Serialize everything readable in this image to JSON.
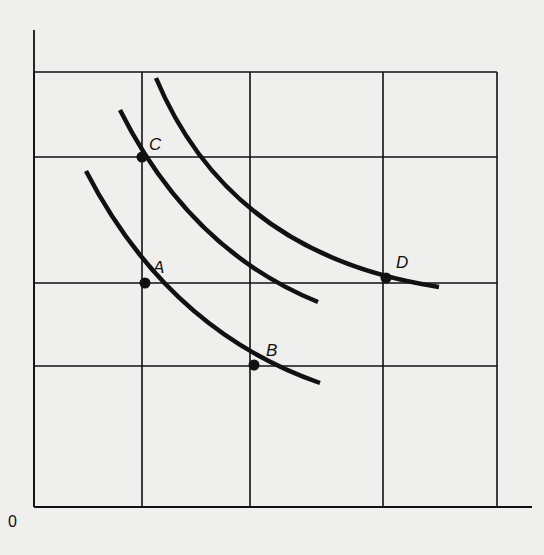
{
  "diagram": {
    "type": "indifference-curve-grid",
    "origin_label": "0",
    "colors": {
      "background": "#efefed",
      "ink": "#111111"
    },
    "axes": {
      "y_axis": {
        "x": 34,
        "y_top": 30,
        "y_bottom": 507
      },
      "x_axis": {
        "y": 507,
        "x_left": 34,
        "x_right": 532
      }
    },
    "grid": {
      "vertical_x": [
        34,
        142,
        250,
        383,
        497
      ],
      "horizontal_y": [
        72,
        157,
        283,
        366,
        507
      ],
      "top": 72,
      "bottom": 507,
      "left": 34,
      "right": 497
    },
    "curves": [
      {
        "name": "curve-1",
        "through": [
          "A",
          "B"
        ],
        "path": "M86,171 Q168,330 320,383"
      },
      {
        "name": "curve-2",
        "through": [
          "C"
        ],
        "path": "M120,110 Q190,250 318,302"
      },
      {
        "name": "curve-3",
        "through": [
          "D"
        ],
        "path": "M156,78 Q230,255 439,287"
      }
    ],
    "points": [
      {
        "label": "C",
        "x": 142,
        "y": 157,
        "label_x": 149,
        "label_y": 150
      },
      {
        "label": "A",
        "x": 145,
        "y": 283,
        "label_x": 153,
        "label_y": 273
      },
      {
        "label": "B",
        "x": 254,
        "y": 365,
        "label_x": 266,
        "label_y": 356
      },
      {
        "label": "D",
        "x": 386,
        "y": 278,
        "label_x": 396,
        "label_y": 268
      }
    ]
  }
}
